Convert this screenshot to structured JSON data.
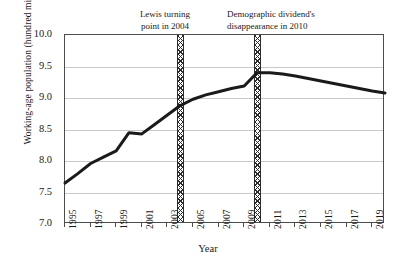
{
  "chart_data": {
    "type": "line",
    "title": "",
    "xlabel": "Year",
    "ylabel": "Working-age population (hundred million)",
    "xlim": [
      1995,
      2020
    ],
    "ylim": [
      7.0,
      10.0
    ],
    "ytick_labels": [
      "10.0",
      "9.5",
      "9.0",
      "8.5",
      "8.0",
      "7.5",
      "7.0"
    ],
    "ytick_values": [
      10.0,
      9.5,
      9.0,
      8.5,
      8.0,
      7.5,
      7.0
    ],
    "xtick_labels": [
      "1995",
      "1997",
      "1999",
      "2001",
      "2003",
      "2005",
      "2007",
      "2009",
      "2011",
      "2013",
      "2015",
      "2017",
      "2019"
    ],
    "xtick_values": [
      1995,
      1997,
      1999,
      2001,
      2003,
      2005,
      2007,
      2009,
      2011,
      2013,
      2015,
      2017,
      2019
    ],
    "grid": "horizontal",
    "legend": "none",
    "line_color": "#1a1a1a",
    "line_width": 3,
    "x": [
      1995,
      1996,
      1997,
      1998,
      1999,
      2000,
      2001,
      2002,
      2003,
      2004,
      2005,
      2006,
      2007,
      2008,
      2009,
      2010,
      2011,
      2012,
      2013,
      2014,
      2015,
      2016,
      2017,
      2018,
      2019,
      2020
    ],
    "values": [
      7.65,
      7.8,
      7.96,
      8.06,
      8.16,
      8.45,
      8.43,
      8.58,
      8.73,
      8.88,
      8.98,
      9.05,
      9.1,
      9.15,
      9.19,
      9.4,
      9.4,
      9.38,
      9.35,
      9.31,
      9.27,
      9.23,
      9.19,
      9.15,
      9.11,
      9.08
    ],
    "series": [
      {
        "name": "Working-age population",
        "values": [
          7.65,
          7.8,
          7.96,
          8.06,
          8.16,
          8.45,
          8.43,
          8.58,
          8.73,
          8.88,
          8.98,
          9.05,
          9.1,
          9.15,
          9.19,
          9.4,
          9.4,
          9.38,
          9.35,
          9.31,
          9.27,
          9.23,
          9.19,
          9.15,
          9.11,
          9.08
        ]
      }
    ],
    "annotations": [
      {
        "id": "lewis",
        "text": "Lewis turning\npoint in 2004",
        "marker_type": "cross-hatched-vertical-band",
        "x": 2004
      },
      {
        "id": "demographic-dividend",
        "text": "Demographic dividend's\ndisappearance in 2010",
        "marker_type": "cross-hatched-vertical-band",
        "x": 2010
      }
    ]
  }
}
